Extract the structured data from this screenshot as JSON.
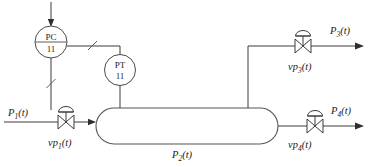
{
  "diagram": {
    "stroke_color": "#3c3c3c",
    "vessel_stroke": "#555555",
    "background": "#ffffff",
    "instruments": [
      {
        "name": "pressure-controller",
        "function_letters": "PC",
        "tag_number": "11",
        "has_divider": true
      },
      {
        "name": "pressure-transmitter",
        "function_letters": "PT",
        "tag_number": "11",
        "has_divider": false
      }
    ],
    "vessel": {
      "label_base": "P",
      "label_sub": "2",
      "label_paren": "(t)",
      "label_full": "P2(t)"
    },
    "streams": [
      {
        "name": "inlet-stream",
        "label_base": "P",
        "label_sub": "1",
        "label_paren": "(t)",
        "label_full": "P1(t)",
        "direction": "in"
      },
      {
        "name": "upper-outlet-stream",
        "label_base": "P",
        "label_sub": "3",
        "label_paren": "(t)",
        "label_full": "P3(t)",
        "direction": "out"
      },
      {
        "name": "lower-outlet-stream",
        "label_base": "P",
        "label_sub": "4",
        "label_paren": "(t)",
        "label_full": "P4(t)",
        "direction": "out"
      }
    ],
    "valves": [
      {
        "name": "inlet-control-valve",
        "label_base": "vp",
        "label_sub": "1",
        "label_paren": "(t)",
        "label_full": "vp1(t)"
      },
      {
        "name": "upper-outlet-control-valve",
        "label_base": "vp",
        "label_sub": "3",
        "label_paren": "(t)",
        "label_full": "vp3(t)"
      },
      {
        "name": "lower-outlet-control-valve",
        "label_base": "vp",
        "label_sub": "4",
        "label_paren": "(t)",
        "label_full": "vp4(t)"
      }
    ],
    "signals": [
      {
        "name": "setpoint-signal",
        "style": "arrow-into-controller"
      },
      {
        "name": "controller-output-signal",
        "style": "pneumatic-slash"
      },
      {
        "name": "transmitter-measurement-signal",
        "style": "pneumatic-slash"
      }
    ]
  }
}
